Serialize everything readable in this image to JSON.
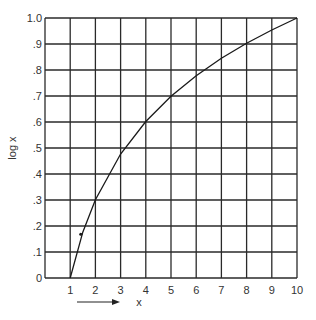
{
  "chart_data": {
    "type": "line",
    "title": "",
    "xlabel": "x",
    "ylabel": "log x",
    "xlim": [
      0,
      10
    ],
    "ylim": [
      0,
      1.0
    ],
    "grid": true,
    "x_ticks": [
      "1",
      "2",
      "3",
      "4",
      "5",
      "6",
      "7",
      "8",
      "9",
      "10"
    ],
    "y_ticks": [
      "0",
      ".1",
      ".2",
      ".3",
      ".4",
      ".5",
      ".6",
      ".7",
      ".8",
      ".9",
      "1.0"
    ],
    "series": [
      {
        "name": "log x",
        "x": [
          1,
          1.5,
          2,
          3,
          4,
          5,
          6,
          7,
          8,
          9,
          10
        ],
        "y": [
          0,
          0.176,
          0.301,
          0.477,
          0.602,
          0.699,
          0.778,
          0.845,
          0.903,
          0.954,
          1.0
        ]
      }
    ],
    "annotations": [
      {
        "type": "arrow",
        "direction": "right",
        "label": "x",
        "position": "below x-axis"
      },
      {
        "type": "dot",
        "x": 1.5,
        "y": 0.176
      }
    ]
  }
}
